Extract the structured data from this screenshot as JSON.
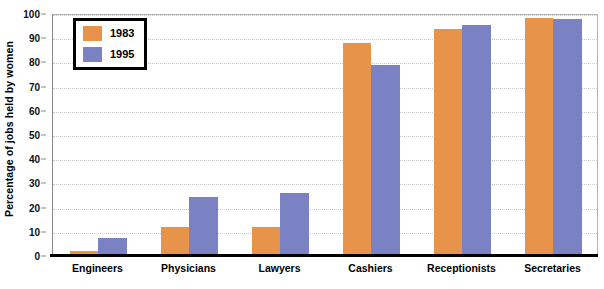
{
  "chart_data": {
    "type": "bar",
    "title": "",
    "xlabel": "",
    "ylabel": "Percentage of jobs held by women",
    "categories": [
      "Engineers",
      "Physicians",
      "Lawyers",
      "Cashiers",
      "Receptionists",
      "Secretaries"
    ],
    "series": [
      {
        "name": "1983",
        "color": "#E8934A",
        "values": [
          2,
          12,
          12,
          88,
          94,
          98.5
        ]
      },
      {
        "name": "1995",
        "color": "#7B82C4",
        "values": [
          7.5,
          24.5,
          26,
          79,
          95.5,
          98
        ]
      }
    ],
    "ylim": [
      0,
      100
    ],
    "ytick_labels": [
      "0",
      "10",
      "20",
      "30",
      "40",
      "50",
      "60",
      "70",
      "80",
      "90",
      "100"
    ],
    "ytick_values": [
      0,
      10,
      20,
      30,
      40,
      50,
      60,
      70,
      80,
      90,
      100
    ],
    "grid": true,
    "legend_position": "upper-left"
  },
  "legend": {
    "entries": [
      {
        "label": "1983",
        "color": "#E8934A"
      },
      {
        "label": "1995",
        "color": "#7B82C4"
      }
    ]
  },
  "axes": {
    "y_title": "Percentage of jobs held by women"
  },
  "title_remnant": ""
}
